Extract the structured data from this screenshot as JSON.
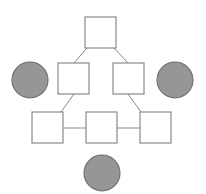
{
  "diagram": {
    "background_color": "#ffffff",
    "canvas": {
      "width": 206,
      "height": 194
    },
    "styles": {
      "square_fill": "#ffffff",
      "square_stroke": "#808080",
      "circle_fill": "#969696",
      "circle_stroke": "#6e6e6e",
      "edge_stroke": "#8a8a8a",
      "edge_width": 1,
      "node_stroke_width": 1.1
    },
    "nodes": [
      {
        "id": "square-top",
        "shape": "square",
        "label": "",
        "x": 85,
        "y": 17,
        "width": 31,
        "height": 31,
        "fill": "#ffffff"
      },
      {
        "id": "square-middle-left",
        "shape": "square",
        "label": "",
        "x": 58,
        "y": 63,
        "width": 31,
        "height": 31,
        "fill": "#ffffff"
      },
      {
        "id": "square-middle-right",
        "shape": "square",
        "label": "",
        "x": 113,
        "y": 63,
        "width": 31,
        "height": 31,
        "fill": "#ffffff"
      },
      {
        "id": "square-bottom-left",
        "shape": "square",
        "label": "",
        "x": 32,
        "y": 112,
        "width": 31,
        "height": 31,
        "fill": "#ffffff"
      },
      {
        "id": "square-bottom-center",
        "shape": "square",
        "label": "",
        "x": 86,
        "y": 112,
        "width": 31,
        "height": 31,
        "fill": "#ffffff"
      },
      {
        "id": "square-bottom-right",
        "shape": "square",
        "label": "",
        "x": 140,
        "y": 112,
        "width": 31,
        "height": 31,
        "fill": "#ffffff"
      },
      {
        "id": "circle-left",
        "shape": "circle",
        "label": "",
        "cx": 30,
        "cy": 80,
        "r": 18,
        "fill": "#969696"
      },
      {
        "id": "circle-right",
        "shape": "circle",
        "label": "",
        "cx": 175,
        "cy": 80,
        "r": 18,
        "fill": "#969696"
      },
      {
        "id": "circle-bottom",
        "shape": "circle",
        "label": "",
        "cx": 102,
        "cy": 173,
        "r": 18,
        "fill": "#969696"
      }
    ],
    "edges": [
      {
        "id": "edge-top-to-middle-left",
        "from": "square-top",
        "to": "square-middle-left",
        "kind": "diagonal",
        "x1": 87,
        "y1": 48,
        "x2": 74,
        "y2": 63
      },
      {
        "id": "edge-top-to-middle-right",
        "from": "square-top",
        "to": "square-middle-right",
        "kind": "diagonal",
        "x1": 114,
        "y1": 48,
        "x2": 128,
        "y2": 63
      },
      {
        "id": "edge-middle-left-to-bottom-left",
        "from": "square-middle-left",
        "to": "square-bottom-left",
        "kind": "diagonal",
        "x1": 74,
        "y1": 94,
        "x2": 61,
        "y2": 112
      },
      {
        "id": "edge-middle-right-to-bottom-right",
        "from": "square-middle-right",
        "to": "square-bottom-right",
        "kind": "diagonal",
        "x1": 128,
        "y1": 94,
        "x2": 141,
        "y2": 112
      },
      {
        "id": "edge-bottom-left-to-bottom-center",
        "from": "square-bottom-left",
        "to": "square-bottom-center",
        "kind": "horizontal",
        "x1": 63,
        "y1": 128,
        "x2": 86,
        "y2": 128
      },
      {
        "id": "edge-bottom-center-to-bottom-right",
        "from": "square-bottom-center",
        "to": "square-bottom-right",
        "kind": "horizontal",
        "x1": 117,
        "y1": 128,
        "x2": 140,
        "y2": 128
      }
    ],
    "isolated_nodes": [
      "circle-left",
      "circle-right",
      "circle-bottom"
    ]
  }
}
